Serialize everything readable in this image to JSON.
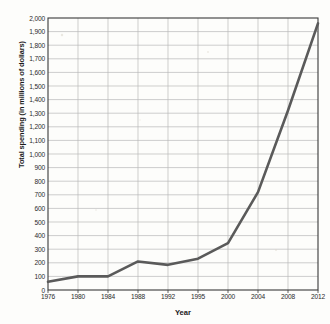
{
  "chart_data": {
    "type": "line",
    "title": "",
    "xlabel": "Year",
    "ylabel": "Total spending (in millions of dollars)",
    "categories": [
      "1976",
      "1980",
      "1984",
      "1988",
      "1992",
      "1995",
      "2000",
      "2004",
      "2008",
      "2012"
    ],
    "x": [
      1976,
      1980,
      1984,
      1988,
      1992,
      1995,
      2000,
      2004,
      2008,
      2012
    ],
    "values": [
      60,
      100,
      100,
      210,
      185,
      230,
      345,
      720,
      1320,
      1960
    ],
    "series": [
      {
        "name": "Total spending",
        "values": [
          60,
          100,
          100,
          210,
          185,
          230,
          345,
          720,
          1320,
          1960
        ]
      }
    ],
    "ylim": [
      0,
      2000
    ],
    "ytick_step": 100,
    "ytick_labels": [
      "0",
      "100",
      "200",
      "300",
      "400",
      "500",
      "600",
      "700",
      "800",
      "900",
      "1,000",
      "1,100",
      "1,200",
      "1,300",
      "1,400",
      "1,500",
      "1,600",
      "1,700",
      "1,800",
      "1,900",
      "2,000"
    ],
    "xtick_labels": [
      "1976",
      "1980",
      "1984",
      "1988",
      "1992",
      "1995",
      "2000",
      "2004",
      "2008",
      "2012"
    ],
    "grid": true,
    "legend": "none",
    "line_color": "#5a5a5a",
    "grid_color": "#b9b9b9",
    "axis_color": "#3a3a3a",
    "background_color": "#fdfdfb",
    "text_color": "#1b1b1b"
  }
}
